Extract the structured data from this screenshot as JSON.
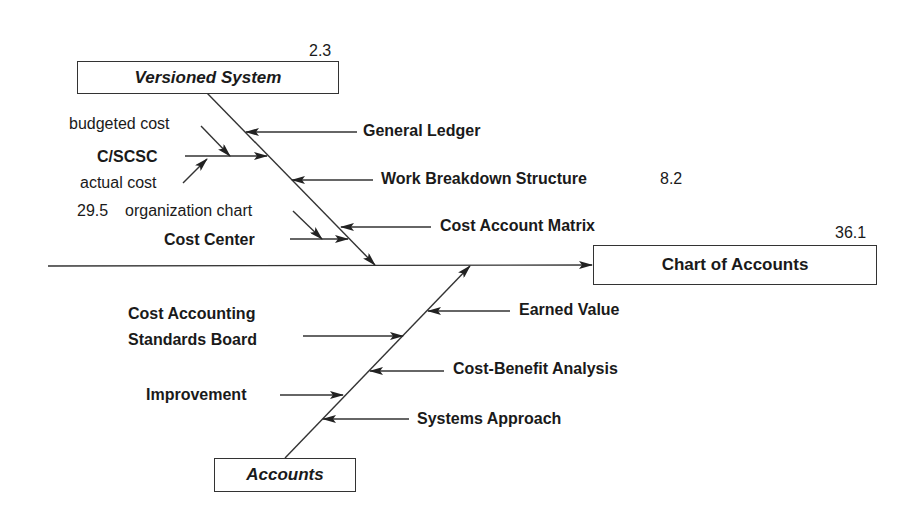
{
  "diagram": {
    "type": "fishbone",
    "effect": {
      "label": "Chart of Accounts",
      "value": "36.1"
    },
    "categories": [
      {
        "label": "Versioned System",
        "value": "2.3",
        "position": "top",
        "causes": [
          {
            "label": "General Ledger",
            "side": "right"
          },
          {
            "label": "C/SCSC",
            "side": "left",
            "subcauses": [
              "budgeted cost",
              "actual cost"
            ]
          },
          {
            "label": "Work Breakdown Structure",
            "side": "right",
            "value": "8.2"
          },
          {
            "label": "Cost Account Matrix",
            "side": "right"
          },
          {
            "label": "Cost Center",
            "side": "left",
            "subcauses": [
              "organization chart"
            ],
            "subcause_value": "29.5"
          }
        ]
      },
      {
        "label": "Accounts",
        "position": "bottom",
        "causes": [
          {
            "label": "Earned Value",
            "side": "right"
          },
          {
            "label": "Cost Accounting Standards Board",
            "side": "left"
          },
          {
            "label": "Cost-Benefit Analysis",
            "side": "right"
          },
          {
            "label": "Improvement",
            "side": "left"
          },
          {
            "label": "Systems Approach",
            "side": "right"
          }
        ]
      }
    ]
  },
  "labels": {
    "versioned_system": "Versioned System",
    "versioned_system_value": "2.3",
    "chart_of_accounts": "Chart of Accounts",
    "chart_of_accounts_value": "36.1",
    "accounts": "Accounts",
    "general_ledger": "General Ledger",
    "budgeted_cost": "budgeted cost",
    "cscsc": "C/SCSC",
    "actual_cost": "actual cost",
    "work_breakdown_structure": "Work Breakdown Structure",
    "wbs_value": "8.2",
    "org_chart_value": "29.5",
    "organization_chart": "organization chart",
    "cost_account_matrix": "Cost Account Matrix",
    "cost_center": "Cost Center",
    "earned_value": "Earned Value",
    "casb_line1": "Cost Accounting",
    "casb_line2": "Standards Board",
    "cost_benefit_analysis": "Cost-Benefit Analysis",
    "improvement": "Improvement",
    "systems_approach": "Systems Approach"
  }
}
